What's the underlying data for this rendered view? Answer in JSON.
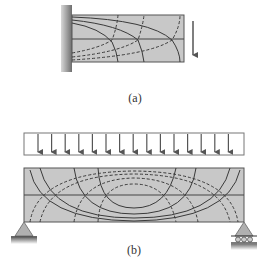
{
  "figure": {
    "panels": [
      {
        "id": "a",
        "label": "(a)",
        "description": "Cantilever beam fixed to a wall with a downward point load at the free end; stress trajectories (solid = tension, dashed = compression)"
      },
      {
        "id": "b",
        "label": "(b)",
        "description": "Simply supported beam (pin left, roller right) under uniformly distributed load; stress trajectories (solid and dashed curves)"
      }
    ],
    "colors": {
      "beam_fill": "#c8c8c8",
      "line": "#3a3a3a",
      "arrow": "#555555",
      "wall": "#8a8a8a"
    },
    "load_arrow_count": 15
  }
}
